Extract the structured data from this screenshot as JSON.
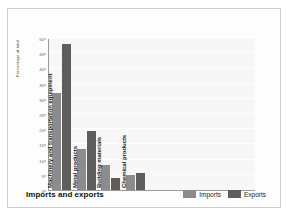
{
  "chart_data": {
    "type": "bar",
    "title": "Imports and exports",
    "xlabel": "",
    "ylabel": "Percentage of total",
    "ylim": [
      0,
      50
    ],
    "yticks": [
      0,
      5,
      10,
      15,
      20,
      25,
      30,
      35,
      40,
      45,
      50
    ],
    "grid": true,
    "legend_position": "bottom-right",
    "categories": [
      "Machinery and transportation equipment",
      "Metal products",
      "Building materials",
      "Chemical products"
    ],
    "series": [
      {
        "name": "Imports",
        "color": "#8c8c8c",
        "values": [
          32,
          13.5,
          8.3,
          5
        ]
      },
      {
        "name": "Exports",
        "color": "#5e5e5e",
        "values": [
          48,
          19.5,
          4,
          5.7
        ]
      }
    ]
  },
  "legend": {
    "items": [
      {
        "label": "Imports"
      },
      {
        "label": "Exports"
      }
    ]
  }
}
